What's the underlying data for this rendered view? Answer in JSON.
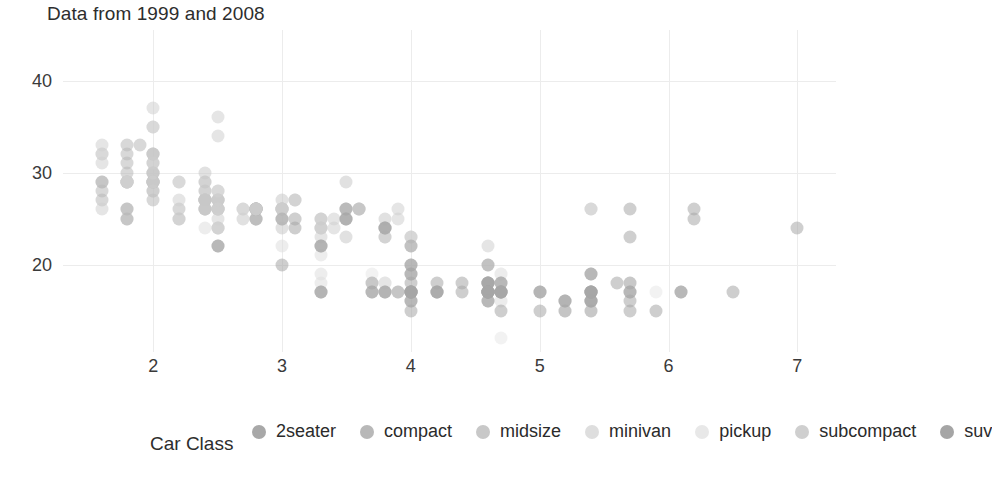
{
  "chart_data": {
    "type": "scatter",
    "title": "Data from 1999 and 2008",
    "xlabel": "",
    "ylabel": "",
    "xlim": [
      1.3,
      7.3
    ],
    "ylim": [
      10.5,
      45.5
    ],
    "xticks": [
      2,
      3,
      4,
      5,
      6,
      7
    ],
    "yticks": [
      20,
      30,
      40
    ],
    "grid": true,
    "legend_position": "bottom",
    "legend_title": "Car Class",
    "point_opacity": 0.55,
    "series": [
      {
        "name": "2seater",
        "color": "#a8a8a8",
        "points": [
          [
            5.7,
            26
          ],
          [
            5.7,
            23
          ],
          [
            6.2,
            26
          ],
          [
            6.2,
            25
          ],
          [
            7.0,
            24
          ]
        ]
      },
      {
        "name": "compact",
        "color": "#b8b8b8",
        "points": [
          [
            1.8,
            29
          ],
          [
            1.8,
            29
          ],
          [
            2.0,
            31
          ],
          [
            2.0,
            30
          ],
          [
            2.8,
            26
          ],
          [
            2.8,
            26
          ],
          [
            3.1,
            27
          ],
          [
            1.8,
            26
          ],
          [
            1.8,
            25
          ],
          [
            2.0,
            28
          ],
          [
            2.0,
            27
          ],
          [
            2.8,
            25
          ],
          [
            2.8,
            25
          ],
          [
            3.1,
            25
          ],
          [
            1.6,
            29
          ],
          [
            1.6,
            29
          ],
          [
            1.6,
            28
          ],
          [
            1.6,
            27
          ],
          [
            1.8,
            26
          ],
          [
            1.8,
            25
          ],
          [
            2.0,
            29
          ],
          [
            2.4,
            27
          ],
          [
            2.4,
            26
          ],
          [
            2.5,
            26
          ],
          [
            2.5,
            27
          ],
          [
            2.2,
            26
          ],
          [
            2.2,
            25
          ],
          [
            2.4,
            27
          ],
          [
            1.9,
            33
          ],
          [
            2.0,
            32
          ],
          [
            2.0,
            29
          ],
          [
            2.5,
            27
          ],
          [
            2.5,
            26
          ],
          [
            2.8,
            26
          ],
          [
            2.8,
            25
          ],
          [
            1.8,
            31
          ],
          [
            1.8,
            30
          ],
          [
            2.0,
            30
          ],
          [
            2.0,
            29
          ],
          [
            2.8,
            26
          ],
          [
            2.8,
            26
          ],
          [
            3.6,
            26
          ],
          [
            1.8,
            33
          ],
          [
            1.8,
            32
          ],
          [
            2.0,
            32
          ],
          [
            2.0,
            29
          ],
          [
            2.8,
            26
          ],
          [
            2.8,
            26
          ],
          [
            3.6,
            26
          ]
        ]
      },
      {
        "name": "midsize",
        "color": "#c8c8c8",
        "points": [
          [
            2.4,
            27
          ],
          [
            3.0,
            26
          ],
          [
            3.3,
            25
          ],
          [
            2.4,
            27
          ],
          [
            2.4,
            26
          ],
          [
            3.1,
            25
          ],
          [
            3.8,
            24
          ],
          [
            2.4,
            27
          ],
          [
            2.4,
            26
          ],
          [
            3.0,
            26
          ],
          [
            3.5,
            29
          ],
          [
            2.4,
            26
          ],
          [
            3.0,
            26
          ],
          [
            3.5,
            26
          ],
          [
            2.4,
            29
          ],
          [
            2.4,
            27
          ],
          [
            3.3,
            24
          ],
          [
            2.4,
            27
          ],
          [
            2.5,
            24
          ],
          [
            3.0,
            24
          ],
          [
            3.5,
            23
          ],
          [
            2.4,
            28
          ],
          [
            2.4,
            28
          ],
          [
            3.0,
            27
          ],
          [
            3.0,
            25
          ],
          [
            3.5,
            25
          ],
          [
            3.8,
            23
          ],
          [
            3.8,
            23
          ],
          [
            2.4,
            30
          ],
          [
            2.4,
            29
          ],
          [
            3.0,
            26
          ],
          [
            3.3,
            25
          ],
          [
            3.3,
            24
          ],
          [
            3.8,
            24
          ],
          [
            4.0,
            23
          ],
          [
            2.5,
            27
          ],
          [
            2.5,
            26
          ],
          [
            2.7,
            25
          ],
          [
            3.0,
            26
          ],
          [
            3.5,
            26
          ],
          [
            3.6,
            26
          ],
          [
            3.8,
            25
          ],
          [
            2.0,
            29
          ],
          [
            2.0,
            28
          ]
        ]
      },
      {
        "name": "minivan",
        "color": "#dedede",
        "points": [
          [
            2.4,
            24
          ],
          [
            3.0,
            22
          ],
          [
            3.3,
            21
          ],
          [
            3.3,
            22
          ],
          [
            3.8,
            18
          ],
          [
            3.8,
            18
          ],
          [
            3.8,
            17
          ],
          [
            3.3,
            17
          ],
          [
            3.3,
            18
          ],
          [
            3.3,
            19
          ],
          [
            4.0,
            17
          ]
        ]
      },
      {
        "name": "pickup",
        "color": "#e8e8e8",
        "points": [
          [
            3.7,
            19
          ],
          [
            3.7,
            18
          ],
          [
            4.0,
            17
          ],
          [
            4.0,
            17
          ],
          [
            4.7,
            19
          ],
          [
            4.7,
            19
          ],
          [
            4.7,
            12
          ],
          [
            4.7,
            17
          ],
          [
            5.2,
            16
          ],
          [
            5.2,
            15
          ],
          [
            3.9,
            17
          ],
          [
            3.9,
            17
          ],
          [
            4.7,
            17
          ],
          [
            4.7,
            16
          ],
          [
            4.7,
            16
          ],
          [
            5.2,
            16
          ],
          [
            5.2,
            15
          ],
          [
            5.7,
            18
          ],
          [
            5.9,
            17
          ],
          [
            4.6,
            17
          ],
          [
            5.4,
            17
          ],
          [
            5.4,
            17
          ],
          [
            4.0,
            17
          ],
          [
            4.0,
            17
          ],
          [
            4.6,
            18
          ],
          [
            5.0,
            17
          ],
          [
            4.2,
            17
          ],
          [
            4.2,
            17
          ],
          [
            4.6,
            18
          ],
          [
            4.6,
            18
          ],
          [
            4.6,
            17
          ],
          [
            5.4,
            16
          ],
          [
            5.4,
            16
          ],
          [
            5.4,
            15
          ]
        ]
      },
      {
        "name": "subcompact",
        "color": "#cfcfcf",
        "points": [
          [
            1.8,
            29
          ],
          [
            1.8,
            29
          ],
          [
            2.0,
            31
          ],
          [
            2.0,
            30
          ],
          [
            2.8,
            26
          ],
          [
            2.8,
            26
          ],
          [
            3.1,
            27
          ],
          [
            2.7,
            26
          ],
          [
            2.7,
            26
          ],
          [
            3.4,
            25
          ],
          [
            3.4,
            24
          ],
          [
            4.0,
            23
          ],
          [
            4.0,
            22
          ],
          [
            2.0,
            35
          ],
          [
            2.0,
            37
          ],
          [
            2.0,
            35
          ],
          [
            2.5,
            26
          ],
          [
            2.5,
            24
          ],
          [
            2.2,
            27
          ],
          [
            2.2,
            25
          ],
          [
            2.5,
            26
          ],
          [
            2.5,
            25
          ],
          [
            2.5,
            24
          ],
          [
            3.0,
            26
          ],
          [
            3.0,
            25
          ],
          [
            3.3,
            23
          ],
          [
            3.3,
            24
          ],
          [
            3.9,
            26
          ],
          [
            3.9,
            25
          ],
          [
            4.6,
            20
          ],
          [
            4.6,
            22
          ],
          [
            5.4,
            26
          ],
          [
            5.4,
            26
          ],
          [
            1.6,
            33
          ],
          [
            1.6,
            32
          ],
          [
            1.6,
            32
          ],
          [
            1.6,
            31
          ],
          [
            1.6,
            26
          ],
          [
            1.8,
            29
          ],
          [
            1.8,
            29
          ],
          [
            2.0,
            32
          ],
          [
            2.0,
            29
          ],
          [
            2.5,
            34
          ],
          [
            2.5,
            36
          ],
          [
            2.2,
            29
          ],
          [
            2.2,
            29
          ],
          [
            2.5,
            28
          ],
          [
            2.5,
            28
          ],
          [
            2.5,
            27
          ]
        ]
      },
      {
        "name": "suv",
        "color": "#a5a5a5",
        "points": [
          [
            4.7,
            17
          ],
          [
            5.7,
            17
          ],
          [
            5.7,
            15
          ],
          [
            6.5,
            17
          ],
          [
            4.7,
            17
          ],
          [
            5.2,
            16
          ],
          [
            5.2,
            16
          ],
          [
            3.9,
            17
          ],
          [
            4.7,
            15
          ],
          [
            5.2,
            15
          ],
          [
            5.7,
            16
          ],
          [
            5.9,
            15
          ],
          [
            4.6,
            17
          ],
          [
            5.4,
            17
          ],
          [
            4.0,
            17
          ],
          [
            4.0,
            17
          ],
          [
            4.6,
            18
          ],
          [
            5.0,
            17
          ],
          [
            4.2,
            17
          ],
          [
            4.2,
            17
          ],
          [
            4.6,
            18
          ],
          [
            4.6,
            18
          ],
          [
            4.6,
            17
          ],
          [
            5.4,
            16
          ],
          [
            5.4,
            16
          ],
          [
            5.4,
            15
          ],
          [
            3.3,
            17
          ],
          [
            3.3,
            17
          ],
          [
            4.0,
            16
          ],
          [
            4.0,
            16
          ],
          [
            4.6,
            17
          ],
          [
            5.0,
            15
          ],
          [
            3.0,
            20
          ],
          [
            3.7,
            18
          ],
          [
            4.0,
            18
          ],
          [
            4.7,
            18
          ],
          [
            4.7,
            18
          ],
          [
            5.7,
            18
          ],
          [
            6.1,
            17
          ],
          [
            4.0,
            19
          ],
          [
            4.0,
            20
          ],
          [
            4.6,
            18
          ],
          [
            5.0,
            17
          ],
          [
            4.2,
            18
          ],
          [
            4.4,
            18
          ],
          [
            4.6,
            17
          ],
          [
            5.4,
            17
          ],
          [
            5.4,
            16
          ],
          [
            2.5,
            22
          ],
          [
            2.5,
            22
          ],
          [
            3.5,
            26
          ],
          [
            3.5,
            25
          ],
          [
            3.0,
            25
          ],
          [
            3.5,
            25
          ],
          [
            3.3,
            22
          ],
          [
            3.3,
            22
          ],
          [
            4.0,
            20
          ],
          [
            5.6,
            18
          ],
          [
            3.1,
            24
          ],
          [
            3.8,
            24
          ],
          [
            3.8,
            24
          ],
          [
            4.0,
            22
          ],
          [
            4.0,
            19
          ],
          [
            4.6,
            20
          ],
          [
            4.6,
            17
          ],
          [
            5.4,
            19
          ],
          [
            5.4,
            19
          ],
          [
            4.0,
            17
          ],
          [
            4.0,
            17
          ],
          [
            4.6,
            16
          ],
          [
            4.6,
            16
          ],
          [
            5.4,
            17
          ],
          [
            3.8,
            17
          ],
          [
            3.8,
            17
          ],
          [
            4.0,
            17
          ],
          [
            4.0,
            15
          ],
          [
            4.6,
            17
          ],
          [
            4.6,
            17
          ],
          [
            5.4,
            17
          ],
          [
            3.7,
            17
          ],
          [
            3.7,
            17
          ],
          [
            4.7,
            17
          ],
          [
            4.7,
            17
          ],
          [
            4.7,
            17
          ],
          [
            5.7,
            17
          ],
          [
            6.1,
            17
          ],
          [
            4.0,
            17
          ],
          [
            4.2,
            17
          ],
          [
            4.4,
            17
          ],
          [
            4.6,
            17
          ],
          [
            5.4,
            17
          ]
        ]
      }
    ]
  },
  "legend": {
    "title": "Car Class",
    "items": [
      {
        "label": "2seater",
        "color": "#a8a8a8"
      },
      {
        "label": "compact",
        "color": "#b8b8b8"
      },
      {
        "label": "midsize",
        "color": "#c8c8c8"
      },
      {
        "label": "minivan",
        "color": "#dedede"
      },
      {
        "label": "pickup",
        "color": "#e8e8e8"
      },
      {
        "label": "subcompact",
        "color": "#cfcfcf"
      },
      {
        "label": "suv",
        "color": "#a5a5a5"
      }
    ]
  },
  "axes": {
    "x_tick_labels": [
      "2",
      "3",
      "4",
      "5",
      "6",
      "7"
    ],
    "y_tick_labels": [
      "20",
      "30",
      "40"
    ]
  },
  "colors": {
    "background": "#ffffff",
    "grid": "#ececec",
    "text": "#2d2d2d"
  }
}
